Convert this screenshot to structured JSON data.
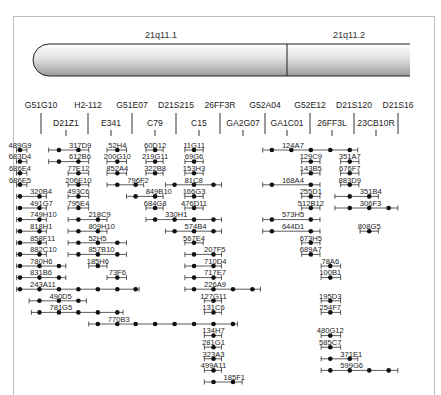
{
  "chromosome": {
    "bands": [
      "21q11.1",
      "21q11.2"
    ]
  },
  "markers_top": [
    "G51G10",
    "H2-112",
    "G51E07",
    "D21S215",
    "26FF3R",
    "G52A04",
    "G52E12",
    "D21S120",
    "D21S16"
  ],
  "markers_bottom": [
    "D21Z1",
    "E341",
    "C79",
    "C15",
    "GA2G07",
    "GA1C01",
    "26FF3L",
    "23CB10R"
  ],
  "marker_order": [
    "G51G10",
    "D21Z1",
    "H2-112",
    "E341",
    "G51E07",
    "C79",
    "D21S215",
    "C15",
    "26FF3R",
    "GA2G07",
    "G52A04",
    "GA1C01",
    "G52E12",
    "26FF3L",
    "D21S120",
    "23CB10R",
    "D21S16"
  ],
  "clones": [
    {
      "name": "489G9",
      "row": 0,
      "dots": [
        0
      ],
      "span": [
        -0.3,
        0.6
      ]
    },
    {
      "name": "683D4",
      "row": 1,
      "dots": [
        0
      ],
      "span": [
        -0.3,
        0.6
      ]
    },
    {
      "name": "686E4",
      "row": 2,
      "dots": [
        0
      ],
      "span": [
        -0.3,
        0.6
      ]
    },
    {
      "name": "686E5",
      "row": 3,
      "dots": [
        0
      ],
      "span": [
        -0.3,
        0.6
      ]
    },
    {
      "name": "320B4",
      "row": 4,
      "dots": [
        0,
        1.7
      ],
      "span": [
        -0.3,
        2.3
      ]
    },
    {
      "name": "491G7",
      "row": 5,
      "dots": [
        0,
        1.7
      ],
      "span": [
        -0.3,
        2.3
      ]
    },
    {
      "name": "749H10",
      "row": 6,
      "dots": [
        0,
        1.7
      ],
      "span": [
        -0.3,
        2.3
      ]
    },
    {
      "name": "818H1",
      "row": 7,
      "dots": [
        0,
        1.7
      ],
      "span": [
        -0.3,
        2.3
      ]
    },
    {
      "name": "858F11",
      "row": 8,
      "dots": [
        0,
        1.7
      ],
      "span": [
        -0.3,
        2.3
      ]
    },
    {
      "name": "882C10",
      "row": 9,
      "dots": [
        0,
        1.7
      ],
      "span": [
        -0.3,
        2.3
      ]
    },
    {
      "name": "780H6",
      "row": 10,
      "dots": [
        0,
        1.7,
        3.4
      ],
      "span": [
        -0.3,
        4
      ]
    },
    {
      "name": "831B6",
      "row": 11,
      "dots": [
        0,
        1.7,
        3.4
      ],
      "span": [
        -0.3,
        4
      ]
    },
    {
      "name": "243A11",
      "row": 12,
      "dots": [
        0,
        1.7,
        3.4,
        5.1,
        6.8,
        8.5,
        10.1
      ],
      "span": [
        -0.3,
        10.4
      ]
    },
    {
      "name": "490D5",
      "row": 13,
      "dots": [
        1.7,
        3.4,
        5.1
      ],
      "span": [
        0.8,
        5.8
      ]
    },
    {
      "name": "781G5",
      "row": 14,
      "dots": [
        1.7,
        3.4,
        5.1,
        6.8,
        8.5
      ],
      "span": [
        1,
        9
      ]
    },
    {
      "name": "317D9",
      "row": 0,
      "dots": [
        3.4,
        5.1
      ],
      "span": [
        2.5,
        6
      ]
    },
    {
      "name": "612B6",
      "row": 1,
      "dots": [
        3.4,
        5.1
      ],
      "span": [
        2.5,
        6
      ]
    },
    {
      "name": "77E12",
      "row": 2,
      "dots": [
        5.1
      ],
      "span": [
        4.2,
        6
      ]
    },
    {
      "name": "206E10",
      "row": 3,
      "dots": [
        5.1
      ],
      "span": [
        4.2,
        6
      ]
    },
    {
      "name": "493C6",
      "row": 4,
      "dots": [
        5.1
      ],
      "span": [
        4.2,
        6
      ]
    },
    {
      "name": "795E4",
      "row": 5,
      "dots": [
        5.1
      ],
      "span": [
        4.2,
        6
      ]
    },
    {
      "name": "218C9",
      "row": 6,
      "dots": [
        5.1,
        6.8
      ],
      "span": [
        4.2,
        7.6
      ]
    },
    {
      "name": "809H10",
      "row": 7,
      "dots": [
        5.1,
        6.8
      ],
      "span": [
        4.2,
        7.6
      ]
    },
    {
      "name": "52H5",
      "row": 8,
      "dots": [
        5.1,
        6.8,
        8.5
      ],
      "span": [
        4.2,
        9.3
      ]
    },
    {
      "name": "857B10",
      "row": 9,
      "dots": [
        5.1,
        6.8,
        8.5
      ],
      "span": [
        4.2,
        9.3
      ]
    },
    {
      "name": "185H6",
      "row": 10,
      "dots": [
        6.8
      ],
      "span": [
        6,
        7.6
      ]
    },
    {
      "name": "73F6",
      "row": 11,
      "dots": [
        8.5
      ],
      "span": [
        7.6,
        9.3
      ]
    },
    {
      "name": "52H4",
      "row": 0,
      "dots": [
        8.5
      ],
      "span": [
        7.6,
        9.3
      ]
    },
    {
      "name": "200G10",
      "row": 1,
      "dots": [
        8.5
      ],
      "span": [
        7.6,
        9.3
      ]
    },
    {
      "name": "852A4",
      "row": 2,
      "dots": [
        8.5
      ],
      "span": [
        7.6,
        9.3
      ]
    },
    {
      "name": "796F2",
      "row": 3,
      "dots": [
        8.5,
        10.1
      ],
      "span": [
        7.6,
        10.8
      ]
    },
    {
      "name": "849B10",
      "row": 4,
      "dots": [
        10.1,
        11.8
      ],
      "span": [
        9.3,
        12.5
      ]
    },
    {
      "name": "684G8",
      "row": 5,
      "dots": [
        11.8
      ],
      "span": [
        11,
        12.5
      ]
    },
    {
      "name": "60D12",
      "row": 0,
      "dots": [
        11.8
      ],
      "span": [
        11,
        12.5
      ]
    },
    {
      "name": "219G11",
      "row": 1,
      "dots": [
        11.8
      ],
      "span": [
        11,
        12.5
      ]
    },
    {
      "name": "322B8",
      "row": 2,
      "dots": [
        11.8
      ],
      "span": [
        11,
        12.5
      ]
    },
    {
      "name": "11G11",
      "row": 0,
      "dots": [
        15.2
      ],
      "span": [
        14.4,
        16
      ]
    },
    {
      "name": "69G6",
      "row": 1,
      "dots": [
        15.2
      ],
      "span": [
        14.4,
        16
      ]
    },
    {
      "name": "153H3",
      "row": 2,
      "dots": [
        15.2
      ],
      "span": [
        14.4,
        16
      ]
    },
    {
      "name": "81C8",
      "row": 3,
      "dots": [
        13.5,
        15.2,
        16.9
      ],
      "span": [
        12.7,
        17.6
      ]
    },
    {
      "name": "166G3",
      "row": 4,
      "dots": [
        15.2
      ],
      "span": [
        14.4,
        16
      ]
    },
    {
      "name": "476D11",
      "row": 5,
      "dots": [
        15.2
      ],
      "span": [
        14.4,
        16
      ]
    },
    {
      "name": "330H1",
      "row": 6,
      "dots": [
        11.8,
        13.5,
        15.2,
        16.9
      ],
      "span": [
        11,
        17.6
      ]
    },
    {
      "name": "574B4",
      "row": 7,
      "dots": [
        13.5,
        15.2,
        16.9
      ],
      "span": [
        12.7,
        17.6
      ]
    },
    {
      "name": "567E4",
      "row": 8,
      "dots": [
        15.2
      ],
      "span": [
        14.4,
        16
      ]
    },
    {
      "name": "207F5",
      "row": 9,
      "dots": [
        15.2,
        16.9
      ],
      "span": [
        14.4,
        17.6
      ]
    },
    {
      "name": "710D4",
      "row": 10,
      "dots": [
        15.2,
        16.9
      ],
      "span": [
        14.4,
        17.6
      ]
    },
    {
      "name": "717E7",
      "row": 11,
      "dots": [
        15.2,
        16.9
      ],
      "span": [
        14.4,
        17.6
      ]
    },
    {
      "name": "226A9",
      "row": 12,
      "dots": [
        15.2,
        16.9,
        18.6,
        20.3
      ],
      "span": [
        14.4,
        21
      ]
    },
    {
      "name": "127G11",
      "row": 13,
      "dots": [
        16.9
      ],
      "span": [
        16.1,
        17.6
      ]
    },
    {
      "name": "131C6",
      "row": 14,
      "dots": [
        16.9
      ],
      "span": [
        16.1,
        17.6
      ]
    },
    {
      "name": "770B3",
      "row": 15,
      "dots": [
        6.8,
        8.5,
        10.1,
        11.8,
        13.5,
        15.2,
        16.9,
        18.6
      ],
      "span": [
        6,
        19
      ]
    },
    {
      "name": "134H7",
      "row": 16,
      "dots": [
        16.9
      ],
      "span": [
        16.1,
        17.6
      ]
    },
    {
      "name": "281G1",
      "row": 17,
      "dots": [
        16.9
      ],
      "span": [
        16.1,
        17.6
      ]
    },
    {
      "name": "323A3",
      "row": 18,
      "dots": [
        16.9
      ],
      "span": [
        16.1,
        17.6
      ]
    },
    {
      "name": "499A11",
      "row": 19,
      "dots": [
        16.9
      ],
      "span": [
        16.1,
        17.6
      ]
    },
    {
      "name": "185F1",
      "row": 20,
      "dots": [
        16.9,
        18.6
      ],
      "span": [
        16.1,
        19.4
      ]
    },
    {
      "name": "124A7",
      "row": 0,
      "dots": [
        22,
        23.7,
        25.4,
        27.1,
        28.8
      ],
      "span": [
        21.2,
        29.5
      ]
    },
    {
      "name": "129C9",
      "row": 1,
      "dots": [
        25.4
      ],
      "span": [
        24.6,
        26.2
      ]
    },
    {
      "name": "143B5",
      "row": 2,
      "dots": [
        25.4
      ],
      "span": [
        24.6,
        26.2
      ]
    },
    {
      "name": "168A4",
      "row": 3,
      "dots": [
        22,
        25.4
      ],
      "span": [
        21.2,
        26.2
      ]
    },
    {
      "name": "255D1",
      "row": 4,
      "dots": [
        25.4
      ],
      "span": [
        24.6,
        26.2
      ]
    },
    {
      "name": "512B12",
      "row": 5,
      "dots": [
        25.4
      ],
      "span": [
        24.6,
        26.2
      ]
    },
    {
      "name": "573H5",
      "row": 6,
      "dots": [
        22,
        25.4
      ],
      "span": [
        21.2,
        26.2
      ]
    },
    {
      "name": "644D1",
      "row": 7,
      "dots": [
        22,
        25.4
      ],
      "span": [
        21.2,
        26.2
      ]
    },
    {
      "name": "673H5",
      "row": 8,
      "dots": [
        25.4
      ],
      "span": [
        24.6,
        26.2
      ]
    },
    {
      "name": "689A7",
      "row": 9,
      "dots": [
        25.4
      ],
      "span": [
        24.6,
        26.2
      ]
    },
    {
      "name": "78A6",
      "row": 10,
      "dots": [
        27.1
      ],
      "span": [
        26.3,
        28
      ]
    },
    {
      "name": "100B1",
      "row": 11,
      "dots": [
        27.1
      ],
      "span": [
        26.3,
        28
      ]
    },
    {
      "name": "195D3",
      "row": 13,
      "dots": [
        27.1
      ],
      "span": [
        26.3,
        28
      ]
    },
    {
      "name": "254F7",
      "row": 14,
      "dots": [
        27.1
      ],
      "span": [
        26.3,
        28
      ]
    },
    {
      "name": "480G12",
      "row": 16,
      "dots": [
        27.1
      ],
      "span": [
        26.3,
        28
      ]
    },
    {
      "name": "585C7",
      "row": 17,
      "dots": [
        27.1
      ],
      "span": [
        26.3,
        28
      ]
    },
    {
      "name": "371E1",
      "row": 18,
      "dots": [
        27.1,
        28.8
      ],
      "span": [
        26.3,
        29.5
      ]
    },
    {
      "name": "599G6",
      "row": 19,
      "dots": [
        27.1,
        28.8,
        30.5,
        32.2
      ],
      "span": [
        26.3,
        33
      ]
    },
    {
      "name": "351A7",
      "row": 1,
      "dots": [
        28.8
      ],
      "span": [
        28,
        29.6
      ]
    },
    {
      "name": "676F7",
      "row": 2,
      "dots": [
        28.8
      ],
      "span": [
        28,
        29.6
      ]
    },
    {
      "name": "883D9",
      "row": 3,
      "dots": [
        28.8
      ],
      "span": [
        28,
        29.6
      ]
    },
    {
      "name": "351B4",
      "row": 4,
      "dots": [
        28.8,
        30.5
      ],
      "span": [
        27.5,
        31.3
      ]
    },
    {
      "name": "306F3",
      "row": 5,
      "dots": [
        28.8,
        30.5,
        32.2
      ],
      "span": [
        27.5,
        33
      ]
    },
    {
      "name": "808G5",
      "row": 7,
      "dots": [
        30.5
      ],
      "span": [
        29.7,
        31.3
      ]
    }
  ]
}
